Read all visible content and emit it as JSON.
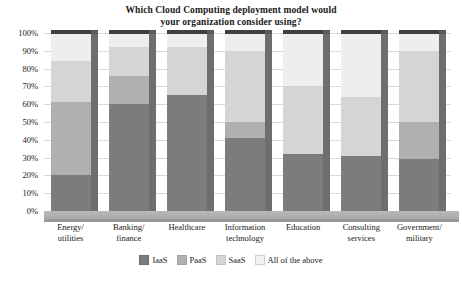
{
  "chart_data": {
    "type": "bar",
    "subtype": "stacked-100-percent-3d",
    "title": "Which Cloud Computing deployment model would your organization consider using?",
    "title_lines": [
      "Which Cloud Computing deployment model would",
      "your organization consider using?"
    ],
    "xlabel": "",
    "ylabel": "",
    "ylim": [
      0,
      100
    ],
    "ytick_labels": [
      "0%",
      "10%",
      "20%",
      "30%",
      "40%",
      "50%",
      "60%",
      "70%",
      "80%",
      "90%",
      "100%"
    ],
    "ytick_values": [
      0,
      10,
      20,
      30,
      40,
      50,
      60,
      70,
      80,
      90,
      100
    ],
    "grid": true,
    "legend_position": "bottom",
    "categories": [
      "Energy/ utilities",
      "Banking/ finance",
      "Healthcare",
      "Information technology",
      "Education",
      "Consulting services",
      "Government/ military"
    ],
    "category_lines": [
      [
        "Energy/",
        "utilities"
      ],
      [
        "Banking/",
        "finance"
      ],
      [
        "Healthcare",
        ""
      ],
      [
        "Information",
        "technology"
      ],
      [
        "Education",
        ""
      ],
      [
        "Consulting",
        "services"
      ],
      [
        "Government/",
        "military"
      ]
    ],
    "series": [
      {
        "name": "IaaS",
        "color": "#7c7c7c",
        "values": [
          20,
          60,
          65,
          41,
          32,
          31,
          29
        ]
      },
      {
        "name": "PaaS",
        "color": "#b0b0b0",
        "values": [
          41,
          16,
          0,
          9,
          0,
          0,
          21
        ]
      },
      {
        "name": "SaaS",
        "color": "#d5d5d5",
        "values": [
          23,
          16,
          27,
          40,
          38,
          33,
          40
        ]
      },
      {
        "name": "All of the above",
        "color": "#eeeeee",
        "values": [
          16,
          8,
          8,
          10,
          30,
          36,
          10
        ]
      }
    ]
  },
  "legend": {
    "items": [
      {
        "label": "IaaS"
      },
      {
        "label": "PaaS"
      },
      {
        "label": "SaaS"
      },
      {
        "label": "All of the above"
      }
    ]
  },
  "colors": {
    "iaas": "#7c7c7c",
    "paas": "#b0b0b0",
    "saas": "#d5d5d5",
    "all": "#eeeeee",
    "gridline": "#d8d8d8",
    "axis": "#8a8a8a",
    "floor": "#b9b9b9",
    "bar_top_cap": "#3f3f3f",
    "bar_side": "#6e6e6e",
    "text": "#1a1a1a",
    "background": "#ffffff"
  }
}
